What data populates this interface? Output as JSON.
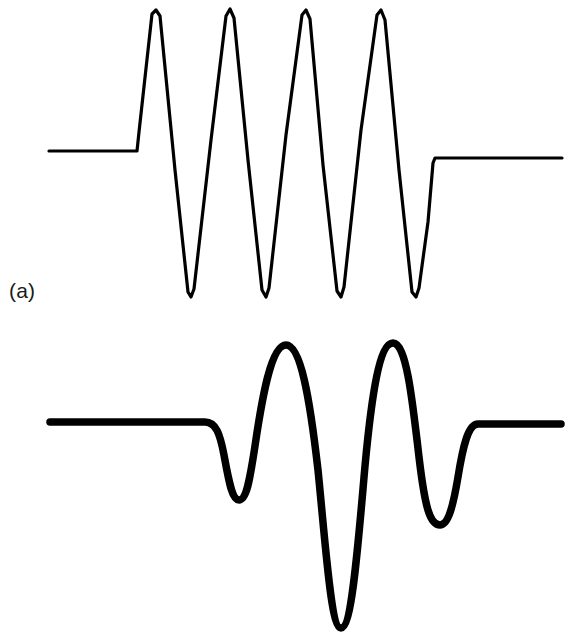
{
  "figure": {
    "background_color": "#ffffff",
    "ink_color": "#000000",
    "width": 569,
    "height": 639,
    "panels": [
      {
        "id": "a",
        "label": "(a)",
        "label_x": 9,
        "label_y": 280,
        "stroke_width": 3.2,
        "description": "Untapered sinusoidal wave burst (rectangular envelope) with four sharp-crested cycles between flat baselines"
      },
      {
        "id": "b",
        "label": "(b)",
        "label_x": 9,
        "label_y": 602,
        "stroke_width": 7.5,
        "description": "Smoothly tapered (Gaussian envelope) wave packet with two large central lobes flanked by two small lobes between flat baselines"
      }
    ]
  },
  "chart_data": {
    "type": "line",
    "title": "",
    "subtitle": "",
    "xlabel": "",
    "ylabel": "",
    "grid": false,
    "legend_position": "none",
    "xlim": [
      0,
      569
    ],
    "ylim": [
      639,
      0
    ],
    "annotations": [
      {
        "text": "(a)",
        "x": 9,
        "y": 280
      },
      {
        "text": "(b)",
        "x": 9,
        "y": 602
      }
    ],
    "series": [
      {
        "name": "(a) rectangular-envelope wave train",
        "stroke": "#000000",
        "stroke_width": 3.2,
        "baseline_left": {
          "y": 151,
          "x_start": 49,
          "x_end": 137
        },
        "baseline_right": {
          "y": 158,
          "x_start": 434,
          "x_end": 562
        },
        "cycles": 4,
        "peak_y": 10,
        "trough_y": 297,
        "peaks_x": [
          155,
          229,
          305,
          380
        ],
        "troughs_x": [
          190,
          265,
          340,
          415
        ],
        "path": "M 49,151 L 137,151 L 139,132 L 152,14 L 156,10 L 160,16 L 175,170 L 188,292 L 191,297 L 194,289 L 211,140 L 226,16 L 230,9 L 234,18 L 248,160 L 262,290 L 266,297 L 269,288 L 286,135 L 302,15 L 306,10 L 310,19 L 323,165 L 337,291 L 341,297 L 344,287 L 361,130 L 377,15 L 381,10 L 385,20 L 399,170 L 412,292 L 416,297 L 419,288 L 428,222 L 433,163 L 435,158 L 562,158"
      },
      {
        "name": "(b) tapered wave packet",
        "stroke": "#000000",
        "stroke_width": 7.5,
        "baseline_left": {
          "y": 422,
          "x_start": 50,
          "x_end": 208
        },
        "baseline_right": {
          "y": 424,
          "x_start": 478,
          "x_end": 561
        },
        "lobes": [
          {
            "type": "trough",
            "x": 239,
            "y": 500,
            "size": "small"
          },
          {
            "type": "peak",
            "x": 286,
            "y": 345,
            "size": "large"
          },
          {
            "type": "trough",
            "x": 341,
            "y": 628,
            "size": "largest"
          },
          {
            "type": "peak",
            "x": 393,
            "y": 343,
            "size": "large"
          },
          {
            "type": "trough",
            "x": 440,
            "y": 525,
            "size": "small"
          }
        ],
        "path": "M 50,422 L 205,422 C 216,422 220,434 224,455 C 229,482 232,500 239,500 C 247,500 250,478 255,446 C 262,398 271,345 286,345 C 301,345 310,400 318,470 C 326,550 331,628 341,628 C 352,628 358,545 365,466 C 372,391 380,343 393,343 C 406,343 412,396 419,457 C 425,508 430,525 440,525 C 448,525 453,507 458,477 C 463,446 468,424 478,424 L 561,424"
      }
    ]
  }
}
